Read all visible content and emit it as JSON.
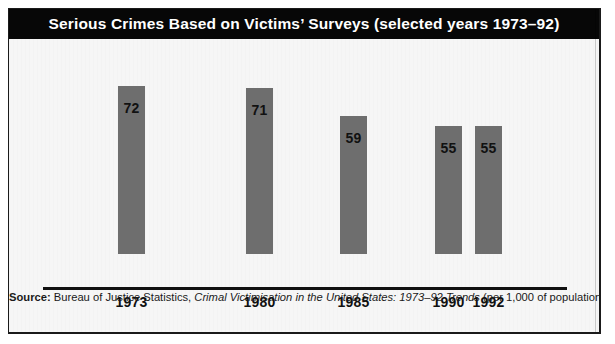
{
  "figure": {
    "title": "Serious Crimes Based on Victims’ Surveys (selected years 1973–92)",
    "source": {
      "label": "Source:",
      "publisher": " Bureau of Justice Statistics, ",
      "work": "Crimal Victimisation in the United States: 1973–92 Trends",
      "note": " (per 1,000 of population)"
    },
    "colors": {
      "bar": "#6e6e6e",
      "title_bar": "#070707",
      "title_text": "#ffffff",
      "axis": "#111111",
      "background": "#f6f6f6",
      "frame": "#1a1a1a"
    }
  },
  "chart_data": {
    "type": "bar",
    "title": "Serious Crimes Based on Victims’ Surveys (selected years 1973–92)",
    "xlabel": "",
    "ylabel": "",
    "ylim": [
      0,
      72
    ],
    "grid": false,
    "legend": "none",
    "units": "per 1,000 of population",
    "categories": [
      "1973",
      "1980",
      "1985",
      "1990",
      "1992"
    ],
    "values": [
      72,
      71,
      59,
      55,
      55
    ],
    "data_labels": [
      "72",
      "71",
      "59",
      "55",
      "55"
    ],
    "bars": [
      {
        "category": "1973",
        "value": 72,
        "label": "72",
        "left": 109,
        "width": 27
      },
      {
        "category": "1980",
        "value": 71,
        "label": "71",
        "left": 237,
        "width": 27
      },
      {
        "category": "1985",
        "value": 59,
        "label": "59",
        "left": 331,
        "width": 27
      },
      {
        "category": "1990",
        "value": 55,
        "label": "55",
        "left": 426,
        "width": 27
      },
      {
        "category": "1992",
        "value": 55,
        "label": "55",
        "left": 466,
        "width": 27
      }
    ]
  }
}
